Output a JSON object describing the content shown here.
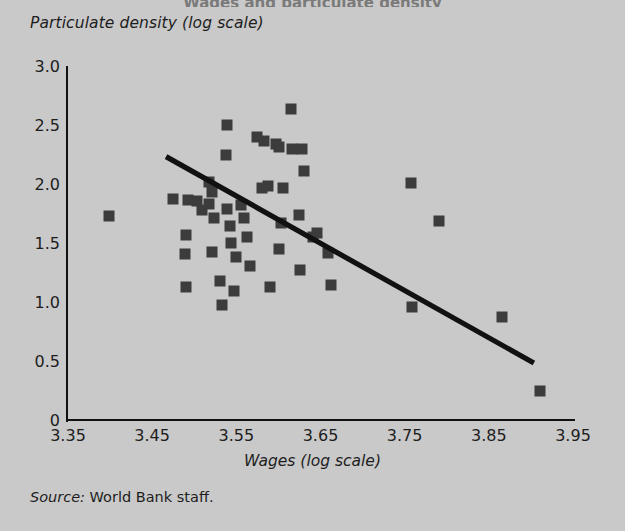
{
  "figure": {
    "background_color": "#c9c9c9",
    "marker_color": "#3c3c3c",
    "line_color": "#111111",
    "source_keyword": "Source:",
    "source_text": " World Bank staff.",
    "title_clipped": "Wages and particulate density"
  },
  "chart_data": {
    "type": "scatter",
    "title": "",
    "xlabel": "Wages (log scale)",
    "ylabel": "Particulate density (log scale)",
    "xlim": [
      3.35,
      3.95
    ],
    "ylim": [
      0,
      3.0
    ],
    "grid": false,
    "legend": null,
    "xticks": [
      "3.35",
      "3.45",
      "3.55",
      "3.65",
      "3.75",
      "3.85",
      "3.95"
    ],
    "xtick_values": [
      3.35,
      3.45,
      3.55,
      3.65,
      3.75,
      3.85,
      3.95
    ],
    "yticks": [
      "0",
      "0.5",
      "1.0",
      "1.5",
      "2.0",
      "2.5",
      "3.0"
    ],
    "ytick_values": [
      0,
      0.5,
      1.0,
      1.5,
      2.0,
      2.5,
      3.0
    ],
    "trend_line": {
      "x": [
        3.4665,
        3.9035
      ],
      "y": [
        2.232,
        0.483
      ]
    },
    "points": [
      {
        "x": 3.3985,
        "y": 1.729
      },
      {
        "x": 3.4745,
        "y": 1.873
      },
      {
        "x": 3.4925,
        "y": 1.865
      },
      {
        "x": 3.4905,
        "y": 1.568
      },
      {
        "x": 3.4885,
        "y": 1.407
      },
      {
        "x": 3.4905,
        "y": 1.127
      },
      {
        "x": 3.5035,
        "y": 1.856
      },
      {
        "x": 3.5095,
        "y": 1.78
      },
      {
        "x": 3.5175,
        "y": 2.017
      },
      {
        "x": 3.5215,
        "y": 1.932
      },
      {
        "x": 3.5175,
        "y": 1.831
      },
      {
        "x": 3.5235,
        "y": 1.712
      },
      {
        "x": 3.5215,
        "y": 1.424
      },
      {
        "x": 3.5305,
        "y": 1.178
      },
      {
        "x": 3.5325,
        "y": 0.974
      },
      {
        "x": 3.5395,
        "y": 2.503
      },
      {
        "x": 3.5375,
        "y": 2.249
      },
      {
        "x": 3.5395,
        "y": 1.788
      },
      {
        "x": 3.5425,
        "y": 1.644
      },
      {
        "x": 3.5435,
        "y": 1.5
      },
      {
        "x": 3.5495,
        "y": 1.382
      },
      {
        "x": 3.5475,
        "y": 1.093
      },
      {
        "x": 3.5555,
        "y": 1.822
      },
      {
        "x": 3.5595,
        "y": 1.712
      },
      {
        "x": 3.5625,
        "y": 1.551
      },
      {
        "x": 3.5665,
        "y": 1.305
      },
      {
        "x": 3.5745,
        "y": 2.402
      },
      {
        "x": 3.5825,
        "y": 2.368
      },
      {
        "x": 3.5805,
        "y": 1.966
      },
      {
        "x": 3.5875,
        "y": 1.983
      },
      {
        "x": 3.5905,
        "y": 1.127
      },
      {
        "x": 3.5975,
        "y": 2.342
      },
      {
        "x": 3.6005,
        "y": 2.317
      },
      {
        "x": 3.6025,
        "y": 1.669
      },
      {
        "x": 3.6005,
        "y": 1.449
      },
      {
        "x": 3.6055,
        "y": 1.966
      },
      {
        "x": 3.6155,
        "y": 2.639
      },
      {
        "x": 3.6165,
        "y": 2.3
      },
      {
        "x": 3.6285,
        "y": 2.3
      },
      {
        "x": 3.6305,
        "y": 2.114
      },
      {
        "x": 3.6245,
        "y": 1.737
      },
      {
        "x": 3.6255,
        "y": 1.271
      },
      {
        "x": 3.6415,
        "y": 1.551
      },
      {
        "x": 3.6455,
        "y": 1.585
      },
      {
        "x": 3.6595,
        "y": 1.415
      },
      {
        "x": 3.6625,
        "y": 1.144
      },
      {
        "x": 3.7575,
        "y": 2.008
      },
      {
        "x": 3.7905,
        "y": 1.686
      },
      {
        "x": 3.7585,
        "y": 0.958
      },
      {
        "x": 3.8655,
        "y": 0.873
      },
      {
        "x": 3.9105,
        "y": 0.245
      }
    ]
  }
}
